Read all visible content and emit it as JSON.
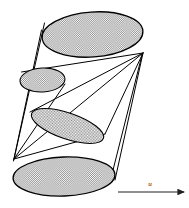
{
  "figure": {
    "background_color": "#ffffff",
    "stroke_color": "#000000",
    "shade_color": "#a8a8a8",
    "width": 189,
    "height": 208
  },
  "annotations": {
    "flow_label": "u",
    "flow_label_x": 150,
    "flow_label_y": 184,
    "arrow": {
      "name": "flow-direction-arrow",
      "x1": 118,
      "y1": 192,
      "x2": 185,
      "y2": 192
    }
  },
  "ellipses": [
    {
      "name": "top-cross-section",
      "cx": 92.5,
      "cy": 34.5,
      "rx": 50.5,
      "ry": 22.5,
      "rotation": -4,
      "shaded": true
    },
    {
      "name": "upper-small-cross-section",
      "cx": 42.5,
      "cy": 80.0,
      "rx": 22.5,
      "ry": 12.0,
      "rotation": -3,
      "shaded": true
    },
    {
      "name": "middle-cross-section",
      "cx": 67.5,
      "cy": 126.0,
      "rx": 38.0,
      "ry": 13.0,
      "rotation": 19,
      "shaded": true
    },
    {
      "name": "bottom-cross-section",
      "cx": 64.0,
      "cy": 176.5,
      "rx": 51.0,
      "ry": 19.5,
      "rotation": -2,
      "shaded": true
    }
  ],
  "generator_lines": [
    {
      "name": "generator-left-outer",
      "x1": 44.5,
      "y1": 23.0,
      "x2": 14.0,
      "y2": 159.0
    },
    {
      "name": "generator-left-inner",
      "x1": 41.5,
      "y1": 30.0,
      "x2": 13.5,
      "y2": 161.0
    },
    {
      "name": "generator-right-outer",
      "x1": 143.0,
      "y1": 53.0,
      "x2": 115.0,
      "y2": 180.0
    },
    {
      "name": "generator-right-inner",
      "x1": 142.0,
      "y1": 55.0,
      "x2": 110.0,
      "y2": 182.0
    },
    {
      "name": "apex-right-to-small-top",
      "x1": 143.0,
      "y1": 53.0,
      "x2": 21.5,
      "y2": 72.0
    },
    {
      "name": "apex-right-to-small-bottom",
      "x1": 143.0,
      "y1": 53.0,
      "x2": 30.0,
      "y2": 112.0
    },
    {
      "name": "apex-right-to-middle",
      "x1": 143.0,
      "y1": 53.0,
      "x2": 105.0,
      "y2": 134.0
    },
    {
      "name": "apex-left-to-top-ellipse",
      "x1": 14.0,
      "y1": 159.0,
      "x2": 143.0,
      "y2": 53.0
    },
    {
      "name": "apex-left-to-middle-right",
      "x1": 14.0,
      "y1": 159.0,
      "x2": 105.0,
      "y2": 134.0
    },
    {
      "name": "apex-left-to-small-right",
      "x1": 14.0,
      "y1": 159.0,
      "x2": 65.0,
      "y2": 84.0
    }
  ]
}
